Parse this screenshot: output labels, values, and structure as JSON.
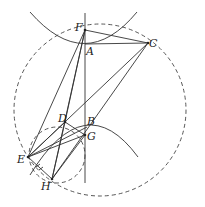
{
  "figure": {
    "type": "geometry-diagram",
    "points": {
      "F": {
        "label": "F",
        "x": 85,
        "y": 30
      },
      "A": {
        "label": "A",
        "x": 85,
        "y": 44
      },
      "C": {
        "label": "C",
        "x": 148,
        "y": 43
      },
      "D": {
        "label": "D",
        "x": 65,
        "y": 122
      },
      "B": {
        "label": "B",
        "x": 87,
        "y": 127
      },
      "G": {
        "label": "G",
        "x": 85,
        "y": 135
      },
      "E": {
        "label": "E",
        "x": 28,
        "y": 157
      },
      "H": {
        "label": "H",
        "x": 52,
        "y": 179
      }
    },
    "labels": [
      "F",
      "A",
      "C",
      "D",
      "B",
      "G",
      "E",
      "H"
    ],
    "segments": [
      "F-A",
      "F-C",
      "A-C",
      "F-E",
      "F-H",
      "C-E",
      "C-H",
      "D-G",
      "D-H",
      "E-G",
      "E-D",
      "E-H",
      "G-H",
      "E-B"
    ],
    "vertical_axis": {
      "x": 85,
      "y1": 13,
      "y2": 183
    },
    "circles": [
      {
        "name": "large-dashed-circle",
        "cx": 100,
        "cy": 110,
        "r": 86,
        "style": "dashed"
      },
      {
        "name": "small-dashed-circle",
        "cx": 57,
        "cy": 155,
        "r": 28,
        "style": "dashed"
      }
    ],
    "curves": [
      {
        "name": "upper-parabola",
        "style": "solid"
      },
      {
        "name": "lower-parabola",
        "style": "solid"
      }
    ],
    "tick_marks": {
      "segment": "E-H",
      "count": 2
    }
  }
}
